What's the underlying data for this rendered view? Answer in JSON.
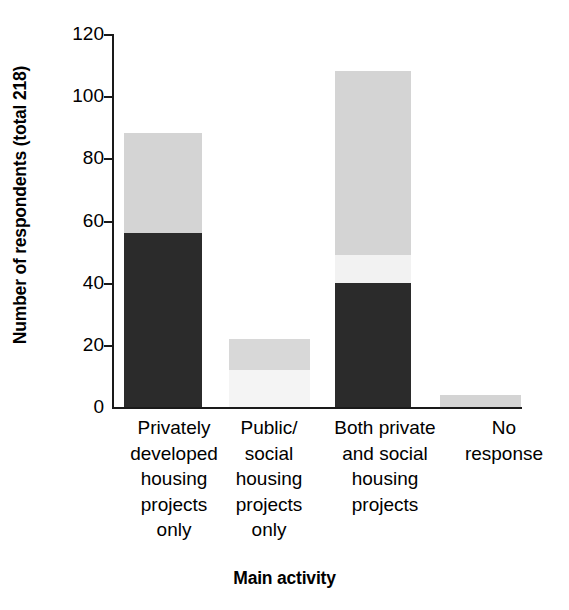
{
  "chart_data": {
    "type": "bar",
    "subtype": "stacked-bar",
    "title": "",
    "xlabel": "Main activity",
    "ylabel": "Number of respondents (total 218)",
    "ylim": [
      0,
      120
    ],
    "yticks": [
      0,
      20,
      40,
      60,
      80,
      100,
      120
    ],
    "grid": false,
    "legend": "none",
    "categories": [
      "Privately\ndeveloped\nhousing\nprojects\nonly",
      "Public/\nsocial\nhousing\nprojects\nonly",
      "Both private\nand social\nhousing\nprojects",
      "No\nresponse"
    ],
    "series": [
      {
        "name": "dark-segment",
        "color": "#2b2b2b",
        "values": [
          56,
          0,
          40,
          0
        ]
      },
      {
        "name": "very-light-segment",
        "color": "#f0f0f0",
        "values": [
          0,
          12,
          9,
          0
        ]
      },
      {
        "name": "mid-gray-segment",
        "color": "#d4d4d4",
        "values": [
          32,
          10,
          59,
          4
        ]
      }
    ],
    "totals": [
      88,
      22,
      108,
      4
    ],
    "bars": [
      {
        "category": "Privately developed housing projects only",
        "total": 88,
        "segments": [
          {
            "name": "dark-segment",
            "from": 0,
            "to": 56,
            "value": 56,
            "color": "#2b2b2b"
          },
          {
            "name": "mid-gray-segment",
            "from": 56,
            "to": 88,
            "value": 32,
            "color": "#d4d4d4"
          }
        ]
      },
      {
        "category": "Public/social housing projects only",
        "total": 22,
        "segments": [
          {
            "name": "very-light-segment",
            "from": 0,
            "to": 12,
            "value": 12,
            "color": "#f4f4f4"
          },
          {
            "name": "mid-gray-segment",
            "from": 12,
            "to": 22,
            "value": 10,
            "color": "#d8d8d8"
          }
        ]
      },
      {
        "category": "Both private and social housing projects",
        "total": 108,
        "segments": [
          {
            "name": "dark-segment",
            "from": 0,
            "to": 40,
            "value": 40,
            "color": "#2b2b2b"
          },
          {
            "name": "very-light-segment",
            "from": 40,
            "to": 49,
            "value": 9,
            "color": "#f2f2f2"
          },
          {
            "name": "mid-gray-segment",
            "from": 49,
            "to": 108,
            "value": 59,
            "color": "#d4d4d4"
          }
        ]
      },
      {
        "category": "No response",
        "total": 4,
        "segments": [
          {
            "name": "mid-gray-segment",
            "from": 0,
            "to": 4,
            "value": 4,
            "color": "#d4d4d4"
          }
        ]
      }
    ]
  },
  "axis": {
    "y_title": "Number of respondents (total 218)",
    "x_title": "Main activity",
    "y_tick_labels": [
      "0",
      "20",
      "40",
      "60",
      "80",
      "100",
      "120"
    ]
  },
  "x_labels": [
    "Privately\ndeveloped\nhousing\nprojects\nonly",
    "Public/\nsocial\nhousing\nprojects\nonly",
    "Both private\nand social\nhousing\nprojects",
    "No\nresponse"
  ],
  "colors": {
    "axis": "#1a1a1a",
    "dark": "#2b2b2b",
    "mid_gray": "#d4d4d4",
    "very_light": "#f2f2f2",
    "background": "#ffffff"
  }
}
